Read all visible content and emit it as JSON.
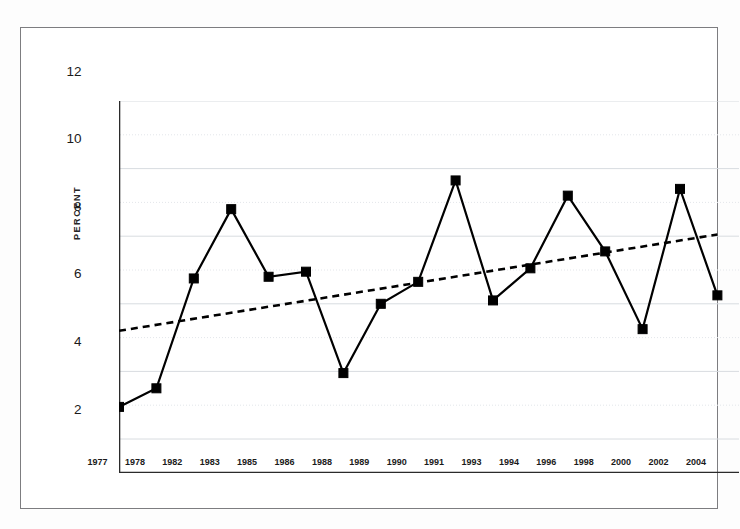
{
  "chart_data": {
    "type": "line",
    "title": "",
    "subtitle": "",
    "xlabel": "",
    "ylabel": "PERCENT",
    "categories": [
      "1977",
      "1978",
      "1982",
      "1983",
      "1985",
      "1986",
      "1988",
      "1989",
      "1990",
      "1991",
      "1993",
      "1994",
      "1996",
      "1998",
      "2000",
      "2002",
      "2004"
    ],
    "series": [
      {
        "name": "Percent",
        "type": "line",
        "marker": "square",
        "color": "#000000",
        "linestyle": "solid",
        "values": [
          2.95,
          3.5,
          6.75,
          8.8,
          6.8,
          6.95,
          3.95,
          6.0,
          6.65,
          9.65,
          6.1,
          7.05,
          9.2,
          7.55,
          5.25,
          9.4,
          6.25
        ]
      },
      {
        "name": "Trend",
        "type": "line",
        "marker": "none",
        "color": "#000000",
        "linestyle": "dashed",
        "endpoints": [
          {
            "x": "1977",
            "y": 5.2
          },
          {
            "x": "2004",
            "y": 8.05
          }
        ]
      }
    ],
    "ylim": [
      0,
      12
    ],
    "y_major_ticks": [
      2,
      4,
      6,
      8,
      10,
      12
    ],
    "y_minor_ticks": [
      1,
      3,
      5,
      7,
      9,
      11
    ],
    "y_tick_labels": [
      "2",
      "4",
      "6",
      "8",
      "10",
      "12"
    ],
    "grid": true,
    "grid_axis": "y",
    "grid_color": "#d8dce0",
    "legend": "none",
    "legend_position": "none",
    "background_color": "#ffffff",
    "frame_color": "#7d7d80"
  },
  "axes": {
    "y_label": "PERCENT",
    "y_tick_labels": [
      "12",
      "10",
      "8",
      "6",
      "4",
      "2"
    ],
    "x_tick_labels": [
      "1977",
      "1978",
      "1982",
      "1983",
      "1985",
      "1986",
      "1988",
      "1989",
      "1990",
      "1991",
      "1993",
      "1994",
      "1996",
      "1998",
      "2000",
      "2002",
      "2004"
    ]
  }
}
